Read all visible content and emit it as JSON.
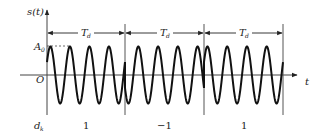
{
  "diagram": {
    "y_axis_label": "s(t)",
    "x_axis_label": "t",
    "origin_label": "O",
    "amplitude_label": "A0",
    "amplitude_label_main": "A",
    "amplitude_label_sub": "0",
    "symbol_period_label_main": "T",
    "symbol_period_label_sub": "d",
    "data_row_label_main": "d",
    "data_row_label_sub": "k",
    "symbols": [
      {
        "value": "1",
        "period": "Td",
        "start_phase": "0"
      },
      {
        "value": "−1",
        "period": "Td",
        "start_phase": "π"
      },
      {
        "value": "1",
        "period": "Td",
        "start_phase": "0"
      }
    ],
    "cycles_per_symbol": 4,
    "colors": {
      "line": "#222222",
      "axis": "#555555",
      "background": "#ffffff"
    }
  }
}
